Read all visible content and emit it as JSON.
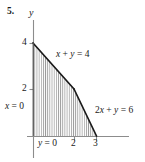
{
  "figure": {
    "problem_number": "5.",
    "axis_label_y": "y",
    "constraint_x0": "x = 0",
    "constraint_y0": "y = 0",
    "constraint_line1": "x + y = 4",
    "constraint_line2": "2x + y = 6",
    "colors": {
      "axis": "#8c8c8c",
      "boundary": "#1a1a1a",
      "hatch": "#9a9a9a",
      "text": "#1a1a1a",
      "background": "#ffffff"
    }
  },
  "chart_data": {
    "type": "line",
    "title": "",
    "xlabel": "",
    "ylabel": "y",
    "xlim": [
      -0.3,
      4.4
    ],
    "ylim": [
      -0.6,
      5.2
    ],
    "grid": false,
    "legend": null,
    "x_ticks": [
      2,
      3
    ],
    "x_tick_labels": [
      "2",
      "3"
    ],
    "y_ticks": [
      2,
      4
    ],
    "y_tick_labels": [
      "2",
      "4"
    ],
    "series": [
      {
        "name": "x + y = 4",
        "label": "x + y = 4",
        "type": "boundary-line",
        "points": [
          [
            0,
            4
          ],
          [
            2,
            2
          ]
        ]
      },
      {
        "name": "2x + y = 6",
        "label": "2x + y = 6",
        "type": "boundary-line",
        "points": [
          [
            2,
            2
          ],
          [
            3,
            0
          ]
        ]
      }
    ],
    "shaded_region": {
      "name": "feasible-region",
      "fill": "vertical-hatch",
      "vertices": [
        [
          0,
          0
        ],
        [
          0,
          4
        ],
        [
          2,
          2
        ],
        [
          3,
          0
        ]
      ]
    },
    "annotations": [
      {
        "text": "x = 0",
        "x": -0.25,
        "y": 1.45,
        "anchor": "left"
      },
      {
        "text": "y = 0",
        "x": 0.5,
        "y": -0.35,
        "anchor": "left"
      },
      {
        "text": "x + y = 4",
        "x": 1.3,
        "y": 3.6,
        "anchor": "left"
      },
      {
        "text": "2x + y = 6",
        "x": 3.0,
        "y": 1.25,
        "anchor": "left"
      }
    ]
  }
}
